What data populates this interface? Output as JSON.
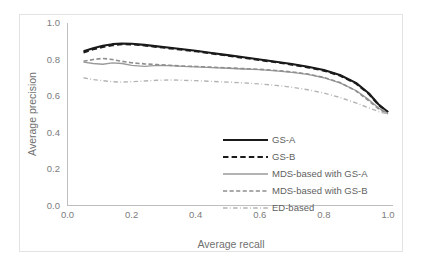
{
  "chart_data": {
    "type": "line",
    "title": "",
    "xlabel": "Average recall",
    "ylabel": "Average precision",
    "xlim": [
      0.0,
      1.0
    ],
    "ylim": [
      0.0,
      1.0
    ],
    "xticks": [
      "0.0",
      "0.2",
      "0.4",
      "0.6",
      "0.8",
      "1.0"
    ],
    "xtick_values": [
      0.0,
      0.2,
      0.4,
      0.6,
      0.8,
      1.0
    ],
    "yticks": [
      "0.0",
      "0.2",
      "0.4",
      "0.6",
      "0.8",
      "1.0"
    ],
    "ytick_values": [
      0.0,
      0.2,
      0.4,
      0.6,
      0.8,
      1.0
    ],
    "grid": false,
    "legend_position": "center-bottom-inside",
    "series": [
      {
        "name": "GS-A",
        "style": "solid",
        "color": "#1a1a1a",
        "width": 2.1,
        "x": [
          0.05,
          0.08,
          0.11,
          0.14,
          0.17,
          0.2,
          0.24,
          0.28,
          0.32,
          0.36,
          0.4,
          0.45,
          0.5,
          0.55,
          0.6,
          0.65,
          0.7,
          0.75,
          0.8,
          0.85,
          0.9,
          0.94,
          0.97,
          1.0
        ],
        "values": [
          0.845,
          0.862,
          0.875,
          0.884,
          0.888,
          0.886,
          0.88,
          0.872,
          0.864,
          0.856,
          0.848,
          0.836,
          0.824,
          0.812,
          0.8,
          0.788,
          0.775,
          0.76,
          0.742,
          0.715,
          0.672,
          0.615,
          0.555,
          0.512
        ]
      },
      {
        "name": "GS-B",
        "style": "dashed",
        "color": "#1a1a1a",
        "width": 2.1,
        "x": [
          0.05,
          0.08,
          0.11,
          0.14,
          0.17,
          0.2,
          0.24,
          0.28,
          0.32,
          0.36,
          0.4,
          0.45,
          0.5,
          0.55,
          0.6,
          0.65,
          0.7,
          0.75,
          0.8,
          0.85,
          0.9,
          0.94,
          0.97,
          1.0
        ],
        "values": [
          0.838,
          0.856,
          0.868,
          0.878,
          0.884,
          0.883,
          0.877,
          0.869,
          0.861,
          0.853,
          0.845,
          0.833,
          0.821,
          0.809,
          0.797,
          0.785,
          0.772,
          0.757,
          0.739,
          0.712,
          0.669,
          0.612,
          0.552,
          0.51
        ]
      },
      {
        "name": "MDS-based with GS-A",
        "style": "solid",
        "color": "#9a9a9a",
        "width": 1.3,
        "x": [
          0.05,
          0.08,
          0.11,
          0.14,
          0.17,
          0.2,
          0.24,
          0.28,
          0.32,
          0.36,
          0.4,
          0.45,
          0.5,
          0.55,
          0.6,
          0.65,
          0.7,
          0.75,
          0.8,
          0.85,
          0.9,
          0.94,
          0.97,
          1.0
        ],
        "values": [
          0.786,
          0.778,
          0.774,
          0.782,
          0.778,
          0.768,
          0.762,
          0.768,
          0.766,
          0.762,
          0.76,
          0.756,
          0.752,
          0.748,
          0.744,
          0.738,
          0.73,
          0.718,
          0.7,
          0.672,
          0.63,
          0.58,
          0.535,
          0.505
        ]
      },
      {
        "name": "MDS-based with GS-B",
        "style": "dashed",
        "color": "#8f8f8f",
        "width": 1.6,
        "x": [
          0.05,
          0.08,
          0.11,
          0.14,
          0.17,
          0.2,
          0.24,
          0.28,
          0.32,
          0.36,
          0.4,
          0.45,
          0.5,
          0.55,
          0.6,
          0.65,
          0.7,
          0.75,
          0.8,
          0.85,
          0.9,
          0.94,
          0.97,
          1.0
        ],
        "values": [
          0.79,
          0.8,
          0.806,
          0.8,
          0.79,
          0.782,
          0.776,
          0.772,
          0.768,
          0.764,
          0.762,
          0.758,
          0.754,
          0.75,
          0.746,
          0.74,
          0.732,
          0.72,
          0.702,
          0.674,
          0.628,
          0.574,
          0.53,
          0.502
        ]
      },
      {
        "name": "ED-based",
        "style": "dashdot",
        "color": "#b4b4b4",
        "width": 1.4,
        "x": [
          0.05,
          0.08,
          0.11,
          0.14,
          0.17,
          0.2,
          0.24,
          0.28,
          0.32,
          0.36,
          0.4,
          0.45,
          0.5,
          0.55,
          0.6,
          0.65,
          0.7,
          0.75,
          0.8,
          0.85,
          0.9,
          0.94,
          0.97,
          1.0
        ],
        "values": [
          0.7,
          0.69,
          0.684,
          0.678,
          0.676,
          0.678,
          0.682,
          0.686,
          0.688,
          0.686,
          0.684,
          0.68,
          0.676,
          0.672,
          0.666,
          0.658,
          0.648,
          0.634,
          0.616,
          0.592,
          0.562,
          0.535,
          0.515,
          0.5
        ]
      }
    ]
  },
  "legend": {
    "items": [
      {
        "label": "GS-A"
      },
      {
        "label": "GS-B"
      },
      {
        "label": "MDS-based with GS-A"
      },
      {
        "label": "MDS-based with GS-B"
      },
      {
        "label": "ED-based"
      }
    ]
  }
}
